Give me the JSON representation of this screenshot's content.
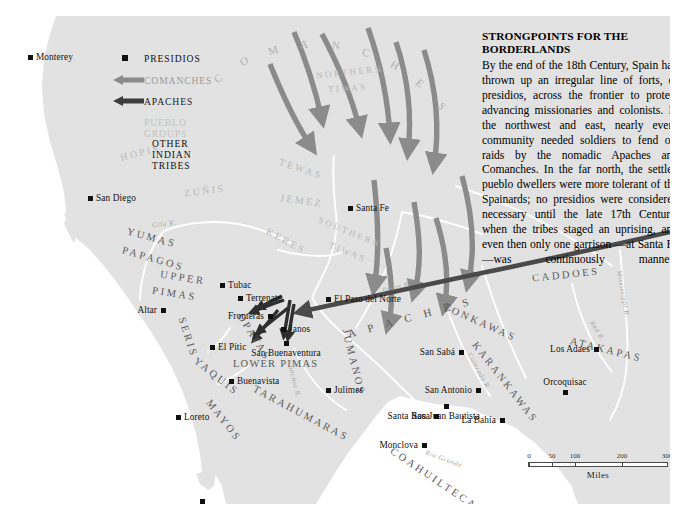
{
  "panel": {
    "title": "STRONGPOINTS FOR THE BORDERLANDS",
    "body": "By the end of the 18th Century, Spain had thrown up an irregular line of forts, or presidios, across the frontier to protect advancing missionaries and colonists. In the northwest and east, nearly every community needed soldiers to fend off raids by the nomadic Apaches and Comanches. In the far north, the settled pueblo dwellers were more tolerant of the Spainards; no presidios were considered necessary until the late 17th Century, when the tribes staged an uprising, and even then only one garrison —at Santa Fe—was continuously manned."
  },
  "legend": {
    "items": [
      {
        "label": "PRESIDIOS",
        "symbol": "square",
        "color": "#111111"
      },
      {
        "label": "COMANCHES",
        "symbol": "arrow-left",
        "color": "#9a9a9a"
      },
      {
        "label": "APACHES",
        "symbol": "arrow-left",
        "color": "#4a4a4a"
      },
      {
        "label": "PUEBLO GROUPS",
        "symbol": "none",
        "color": "#c2c2c2"
      },
      {
        "label": "OTHER INDIAN TRIBES",
        "symbol": "none",
        "color": "#111111"
      }
    ]
  },
  "scale": {
    "ticks": [
      "0",
      "50",
      "100",
      "200",
      "300"
    ],
    "unit": "Miles"
  },
  "cities": [
    {
      "name": "Monterey",
      "x": 12,
      "y": 39,
      "anchor": "right"
    },
    {
      "name": "San Diego",
      "x": 72,
      "y": 180,
      "anchor": "right"
    },
    {
      "name": "Tubac",
      "x": 204,
      "y": 267,
      "anchor": "right"
    },
    {
      "name": "Terrenate",
      "x": 222,
      "y": 280,
      "anchor": "right"
    },
    {
      "name": "Altar",
      "x": 145,
      "y": 292,
      "anchor": "left"
    },
    {
      "name": "Fronteras",
      "x": 252,
      "y": 298,
      "anchor": "left"
    },
    {
      "name": "Janos",
      "x": 265,
      "y": 311,
      "anchor": "right"
    },
    {
      "name": "El Pitic",
      "x": 194,
      "y": 329,
      "anchor": "right"
    },
    {
      "name": "San Buenaventura",
      "x": 268,
      "y": 325,
      "anchor": "below"
    },
    {
      "name": "Buenavista",
      "x": 213,
      "y": 363,
      "anchor": "right"
    },
    {
      "name": "Loreto",
      "x": 160,
      "y": 399,
      "anchor": "right"
    },
    {
      "name": "San José del Cabo",
      "x": 184,
      "y": 483,
      "anchor": "below"
    },
    {
      "name": "Santa Fe",
      "x": 332,
      "y": 190,
      "anchor": "right"
    },
    {
      "name": "El Paso del Norte",
      "x": 310,
      "y": 281,
      "anchor": "right"
    },
    {
      "name": "Julimes",
      "x": 310,
      "y": 372,
      "anchor": "right"
    },
    {
      "name": "San Sabá",
      "x": 443,
      "y": 334,
      "anchor": "left"
    },
    {
      "name": "San Antonio",
      "x": 460,
      "y": 372,
      "anchor": "left"
    },
    {
      "name": "San Juan Bautista",
      "x": 428,
      "y": 388,
      "anchor": "below"
    },
    {
      "name": "Santa Rosa",
      "x": 418,
      "y": 398,
      "anchor": "left"
    },
    {
      "name": "La Bahía",
      "x": 484,
      "y": 402,
      "anchor": "left"
    },
    {
      "name": "Monclova",
      "x": 406,
      "y": 427,
      "anchor": "left"
    },
    {
      "name": "Los Adaes",
      "x": 578,
      "y": 331,
      "anchor": "left"
    },
    {
      "name": "Orcoquisac",
      "x": 547,
      "y": 374,
      "anchor": "above"
    }
  ],
  "tribes": [
    {
      "name": "YUMAS",
      "type": "other"
    },
    {
      "name": "PAPAGOS",
      "type": "other"
    },
    {
      "name": "UPPER PIMAS",
      "type": "other"
    },
    {
      "name": "SERIS",
      "type": "other"
    },
    {
      "name": "OPATAS",
      "type": "other"
    },
    {
      "name": "YAQUIS",
      "type": "other"
    },
    {
      "name": "MAYOS",
      "type": "other"
    },
    {
      "name": "LOWER PIMAS",
      "type": "other"
    },
    {
      "name": "TARAHUMARAS",
      "type": "other"
    },
    {
      "name": "APACHES",
      "type": "other"
    },
    {
      "name": "JUMANOS",
      "type": "other"
    },
    {
      "name": "TONKAWAS",
      "type": "other"
    },
    {
      "name": "KARANKAWAS",
      "type": "other"
    },
    {
      "name": "COAHUILTECANS",
      "type": "other"
    },
    {
      "name": "CADDOES",
      "type": "other"
    },
    {
      "name": "ATAKAPAS",
      "type": "other"
    },
    {
      "name": "COMANCHES",
      "type": "arrow-group"
    },
    {
      "name": "HOPIS",
      "type": "pueblo"
    },
    {
      "name": "ZUÑIS",
      "type": "pueblo"
    },
    {
      "name": "TEWAS",
      "type": "pueblo"
    },
    {
      "name": "JEMEZ",
      "type": "pueblo"
    },
    {
      "name": "KERES",
      "type": "pueblo"
    },
    {
      "name": "NORTHERN TIWAS",
      "type": "pueblo"
    },
    {
      "name": "SOUTHERN TIWAS",
      "type": "pueblo"
    }
  ],
  "rivers": [
    {
      "name": "Gila R."
    },
    {
      "name": "Conchos R."
    },
    {
      "name": "Pecos R."
    },
    {
      "name": "Colorado R."
    },
    {
      "name": "Red R."
    },
    {
      "name": "Rio Grande"
    },
    {
      "name": "Mississippi R."
    }
  ],
  "colors": {
    "land": "#e2e2e2",
    "water": "#ffffff",
    "paper": "#f2f2f2",
    "comanche_arrow": "#8b8b8b",
    "apache_arrow": "#4a4a4a",
    "pueblo_text": "#c2c2c2",
    "tribe_text": "#5b5b5b",
    "city_text": "#111111"
  },
  "labels": {
    "hopis": "HOPIS",
    "zunis": "ZUÑIS",
    "tewas": "TEWAS",
    "jemez": "JEMEZ",
    "keres": "KERES",
    "northern_tiwas_a": "NORTHERN",
    "northern_tiwas_b": "TIWAS",
    "southern_tiwas_a": "SOUTHERN",
    "southern_tiwas_b": "TIWAS",
    "apaches": "A P A C H E S",
    "comanches": "COMANCHES",
    "yumas": "YUMAS",
    "papagos": "PAPAGOS",
    "upper_pimas_a": "UPPER",
    "upper_pimas_b": "PIMAS",
    "seris": "SERIS",
    "opatas": "OPATAS",
    "yaquis": "YAQUIS",
    "mayos": "MAYOS",
    "lower_pimas": "LOWER PIMAS",
    "tarahumaras": "TARAHUMARAS",
    "jumanos": "JUMANOS",
    "tonkawas": "TONKAWAS",
    "karankawas": "KARANKAWAS",
    "coahuiltecans": "COAHUILTECANS",
    "caddoes": "CADDOES",
    "atakapas": "ATAKAPAS",
    "gila": "Gila R.",
    "conchos": "Conchos R.",
    "pecos": "Pecos R.",
    "colorado": "Colorado R.",
    "red": "Red R.",
    "riogrande": "Rio Grande",
    "mississippi": "Mississippi R."
  }
}
